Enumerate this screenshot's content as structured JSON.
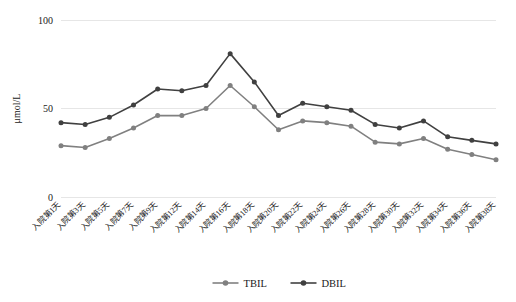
{
  "chart_data": {
    "type": "line",
    "title": "",
    "xlabel": "",
    "ylabel": "μmol/L",
    "ylim": [
      0,
      100
    ],
    "yticks": [
      0,
      50,
      100
    ],
    "ytick_labels": [
      "0",
      "50",
      "100"
    ],
    "grid": true,
    "legend_position": "bottom",
    "categories": [
      "入院第1天",
      "入院第3天",
      "入院第5天",
      "入院第7天",
      "入院第9天",
      "入院第12天",
      "入院第14天",
      "入院第16天",
      "入院第18天",
      "入院第20天",
      "入院第22天",
      "入院第24天",
      "入院第26天",
      "入院第28天",
      "入院第30天",
      "入院第32天",
      "入院第34天",
      "入院第36天",
      "入院第38天"
    ],
    "series": [
      {
        "name": "TBIL",
        "color": "#808080",
        "values": [
          29,
          28,
          33,
          39,
          46,
          46,
          50,
          63,
          51,
          38,
          43,
          42,
          40,
          31,
          30,
          33,
          27,
          24,
          21
        ]
      },
      {
        "name": "DBIL",
        "color": "#404040",
        "values": [
          42,
          41,
          45,
          52,
          61,
          60,
          63,
          81,
          65,
          46,
          53,
          51,
          49,
          41,
          39,
          43,
          34,
          32,
          30
        ]
      }
    ]
  },
  "legend": {
    "items": [
      {
        "label": "TBIL",
        "color": "#808080"
      },
      {
        "label": "DBIL",
        "color": "#404040"
      }
    ]
  },
  "axes": {
    "y_title": "μmol/L"
  }
}
